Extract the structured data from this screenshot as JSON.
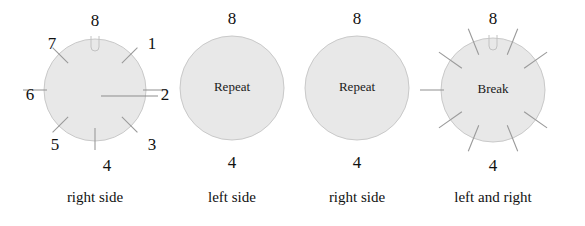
{
  "figure": {
    "background_color": "#ffffff",
    "disc_fill": "#e8e8e8",
    "disc_stroke": "#c9c9c9",
    "tick_color": "#9a9a9a",
    "text_color": "#111111"
  },
  "dials": [
    {
      "id": "dial-1",
      "caption": "right side",
      "inner_label": "",
      "center": {
        "x": 95,
        "y": 90
      },
      "radius": 51,
      "numbers": [
        {
          "label": "8",
          "x": 95,
          "y": 22
        },
        {
          "label": "1",
          "x": 152,
          "y": 45
        },
        {
          "label": "2",
          "x": 165,
          "y": 96
        },
        {
          "label": "3",
          "x": 152,
          "y": 146
        },
        {
          "label": "4",
          "x": 107,
          "y": 167
        },
        {
          "label": "5",
          "x": 55,
          "y": 146
        },
        {
          "label": "6",
          "x": 30,
          "y": 96
        },
        {
          "label": "7",
          "x": 52,
          "y": 45
        }
      ],
      "ticks": [
        {
          "angle_deg": 45,
          "kind": "short"
        },
        {
          "angle_deg": 90,
          "kind": "long"
        },
        {
          "angle_deg": 135,
          "kind": "short"
        },
        {
          "angle_deg": 180,
          "kind": "short"
        },
        {
          "angle_deg": 225,
          "kind": "short"
        },
        {
          "angle_deg": 270,
          "kind": "long"
        },
        {
          "angle_deg": 315,
          "kind": "short"
        }
      ],
      "has_top_notch": true
    },
    {
      "id": "dial-2",
      "caption": "left side",
      "inner_label": "Repeat",
      "center": {
        "x": 232,
        "y": 88
      },
      "radius": 52,
      "numbers": [
        {
          "label": "8",
          "x": 232,
          "y": 20
        },
        {
          "label": "4",
          "x": 232,
          "y": 164
        }
      ],
      "ticks": [],
      "has_top_notch": false
    },
    {
      "id": "dial-3",
      "caption": "right side",
      "inner_label": "Repeat",
      "center": {
        "x": 357,
        "y": 88
      },
      "radius": 52,
      "numbers": [
        {
          "label": "8",
          "x": 357,
          "y": 20
        },
        {
          "label": "4",
          "x": 357,
          "y": 164
        }
      ],
      "ticks": [],
      "has_top_notch": false
    },
    {
      "id": "dial-4",
      "caption": "left and right",
      "inner_label": "Break",
      "center": {
        "x": 493,
        "y": 90
      },
      "radius": 52,
      "numbers": [
        {
          "label": "8",
          "x": 493,
          "y": 20
        },
        {
          "label": "4",
          "x": 493,
          "y": 167
        }
      ],
      "ticks": [
        {
          "angle_deg": 22,
          "kind": "ray"
        },
        {
          "angle_deg": 55,
          "kind": "ray"
        },
        {
          "angle_deg": 125,
          "kind": "ray"
        },
        {
          "angle_deg": 158,
          "kind": "ray"
        },
        {
          "angle_deg": 202,
          "kind": "ray"
        },
        {
          "angle_deg": 235,
          "kind": "ray"
        },
        {
          "angle_deg": 270,
          "kind": "long"
        },
        {
          "angle_deg": 305,
          "kind": "ray"
        },
        {
          "angle_deg": 338,
          "kind": "ray"
        }
      ],
      "has_top_notch": true
    }
  ],
  "captions_y": 199
}
